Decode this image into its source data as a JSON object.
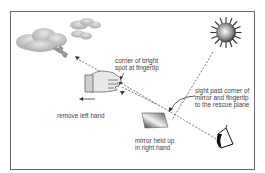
{
  "diagram": {
    "labels": {
      "fingertip": [
        "corner of bright",
        "spot at fingertip"
      ],
      "remove_hand": "remove left hand",
      "sight": [
        "sight past corner of",
        "mirror and fingertip",
        "to the rescue plane"
      ],
      "mirror": [
        "mirror held up",
        "in right hand"
      ]
    },
    "elements": [
      "clouds",
      "rescue-plane",
      "sun",
      "left-hand",
      "mirror",
      "eye"
    ],
    "colors": {
      "frame": "#6a6a6a",
      "line": "#555555",
      "cloud": "#b8b8b8",
      "text": "#444444"
    }
  }
}
